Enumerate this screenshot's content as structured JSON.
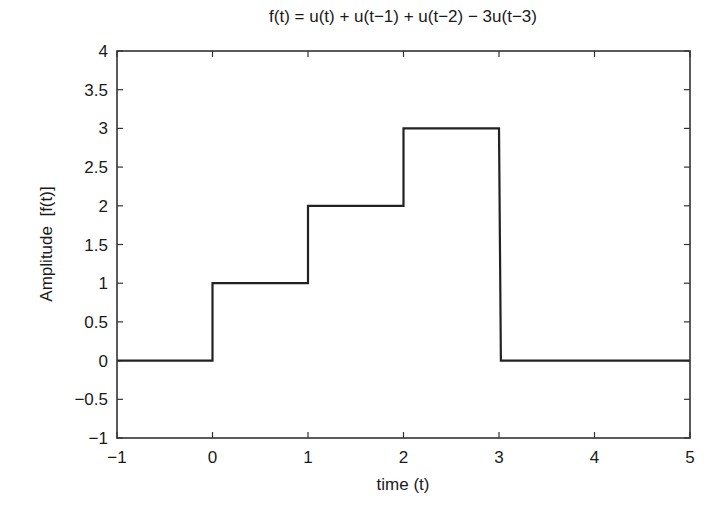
{
  "chart_data": {
    "type": "line",
    "title": "f(t) = u(t) + u(t−1) + u(t−2) − 3u(t−3)",
    "xlabel": "time (t)",
    "ylabel": "Amplitude  [f(t)]",
    "xlim": [
      -1,
      5
    ],
    "ylim": [
      -1,
      4
    ],
    "xticks": [
      -1,
      0,
      1,
      2,
      3,
      4,
      5
    ],
    "xtick_labels": [
      "−1",
      "0",
      "1",
      "2",
      "3",
      "4",
      "5"
    ],
    "yticks": [
      -1,
      -0.5,
      0,
      0.5,
      1,
      1.5,
      2,
      2.5,
      3,
      3.5,
      4
    ],
    "ytick_labels": [
      "−1",
      "−0.5",
      "0",
      "0.5",
      "1",
      "1.5",
      "2",
      "2.5",
      "3",
      "3.5",
      "4"
    ],
    "grid": false,
    "legend": null,
    "series": [
      {
        "name": "f(t)",
        "color": "#222222",
        "x": [
          -1,
          0,
          0,
          1,
          1,
          2,
          2,
          3,
          3.02,
          5
        ],
        "y": [
          0,
          0,
          1,
          1,
          2,
          2,
          3,
          3,
          0,
          0
        ]
      }
    ]
  },
  "colors": {
    "line": "#222222",
    "axes": "#333333",
    "background": "#ffffff"
  }
}
